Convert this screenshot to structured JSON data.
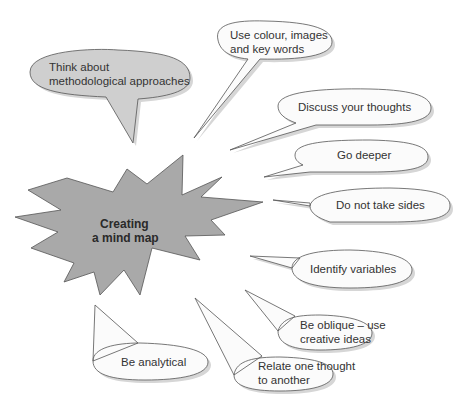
{
  "title": "Creating a mind map",
  "center": {
    "line1": "Creating",
    "line2": "a mind map",
    "fill": "#a9a9a9"
  },
  "bubbles": [
    {
      "id": "methodological",
      "lines": [
        "Think about",
        "methodological approaches"
      ],
      "fill": "#cfcfcf"
    },
    {
      "id": "colour",
      "lines": [
        "Use colour, images",
        "and key words"
      ]
    },
    {
      "id": "discuss",
      "lines": [
        "Discuss your thoughts"
      ]
    },
    {
      "id": "deeper",
      "lines": [
        "Go deeper"
      ]
    },
    {
      "id": "sides",
      "lines": [
        "Do not take sides"
      ]
    },
    {
      "id": "variables",
      "lines": [
        "Identify variables"
      ]
    },
    {
      "id": "oblique",
      "lines": [
        "Be oblique – use",
        "creative ideas"
      ]
    },
    {
      "id": "relate",
      "lines": [
        "Relate one thought",
        "to another"
      ]
    },
    {
      "id": "analytical",
      "lines": [
        "Be analytical"
      ]
    }
  ]
}
